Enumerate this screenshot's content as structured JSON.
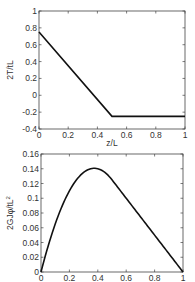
{
  "chart_data": [
    {
      "type": "line",
      "title": "",
      "xlabel": "z/L",
      "ylabel": "2T/tL",
      "xlim": [
        0,
        1
      ],
      "ylim": [
        -0.4,
        1
      ],
      "xticks": [
        "0",
        "0.2",
        "0.4",
        "0.6",
        "0.8",
        "1"
      ],
      "yticks": [
        "-0.4",
        "-0.2",
        "0",
        "0.2",
        "0.4",
        "0.6",
        "0.8",
        "1"
      ],
      "grid": false,
      "legend": null,
      "series": [
        {
          "name": "2T/tL",
          "x": [
            0,
            0.5,
            1
          ],
          "y": [
            0.75,
            -0.25,
            -0.25
          ]
        }
      ]
    },
    {
      "type": "line",
      "title": "",
      "xlabel": "",
      "ylabel": "2GJφ/tL²",
      "xlim": [
        0,
        1
      ],
      "ylim": [
        0,
        0.16
      ],
      "xticks": [
        "0",
        "0.2",
        "0.4",
        "0.6",
        "0.8",
        "1"
      ],
      "yticks": [
        "0",
        "0.02",
        "0.04",
        "0.06",
        "0.08",
        "0.1",
        "0.12",
        "0.14",
        "0.16"
      ],
      "grid": false,
      "legend": null,
      "series": [
        {
          "name": "2GJφ/tL²",
          "x": [
            0,
            0.05,
            0.1,
            0.15,
            0.2,
            0.25,
            0.3,
            0.35,
            0.375,
            0.4,
            0.45,
            0.5,
            0.6,
            0.7,
            0.8,
            0.9,
            1.0
          ],
          "y": [
            0,
            0.035,
            0.065,
            0.09,
            0.11,
            0.125,
            0.135,
            0.14,
            0.1406,
            0.14,
            0.135,
            0.125,
            0.1,
            0.075,
            0.05,
            0.025,
            0
          ]
        }
      ]
    }
  ],
  "plots": {
    "top": {
      "ylabel": "2T/tL",
      "xlabel": "z/L",
      "xticks": [
        "0",
        "0.2",
        "0.4",
        "0.6",
        "0.8",
        "1"
      ],
      "yticks": [
        "-0.4",
        "-0.2",
        "0",
        "0.2",
        "0.4",
        "0.6",
        "0.8",
        "1"
      ]
    },
    "bottom": {
      "ylabel": "2GJφ/tL",
      "ylabel_sup": "2",
      "xticks": [
        "0",
        "0.2",
        "0.4",
        "0.6",
        "0.8",
        "1"
      ],
      "yticks": [
        "0",
        "0.02",
        "0.04",
        "0.06",
        "0.08",
        "0.1",
        "0.12",
        "0.14",
        "0.16"
      ]
    }
  },
  "colors": {
    "line": "#111111",
    "axes": "#444444",
    "background": "#ffffff"
  }
}
